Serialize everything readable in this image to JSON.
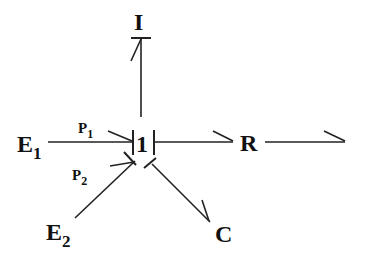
{
  "diagram": {
    "type": "bond-graph",
    "junction": {
      "label": "1"
    },
    "elements": {
      "inertia": {
        "label": "I"
      },
      "resistor": {
        "label": "R"
      },
      "capacitor": {
        "label": "C"
      },
      "source1": {
        "label": "E",
        "subscript": "1"
      },
      "source2": {
        "label": "E",
        "subscript": "2"
      }
    },
    "bond_labels": {
      "p1": {
        "label": "P",
        "subscript": "1"
      },
      "p2": {
        "label": "P",
        "subscript": "2"
      }
    },
    "colors": {
      "ink": "#222222",
      "background": "#ffffff"
    }
  }
}
